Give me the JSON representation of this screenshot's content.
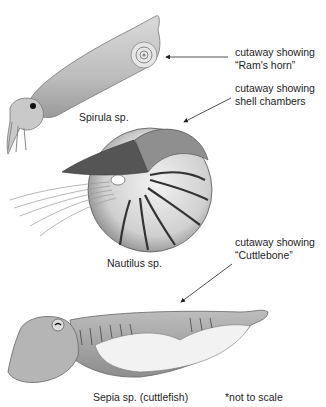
{
  "diagram": {
    "organisms": [
      {
        "name": "Spirula sp.",
        "callout": [
          "cutaway showing",
          "“Ram's horn”"
        ]
      },
      {
        "name": "Nautilus sp.",
        "callout": [
          "cutaway showing",
          "shell chambers"
        ]
      },
      {
        "name": "Sepia sp. (cuttlefish)",
        "callout": [
          "cutaway showing",
          "“Cuttlebone”"
        ]
      }
    ],
    "footnote": "*not to scale"
  }
}
